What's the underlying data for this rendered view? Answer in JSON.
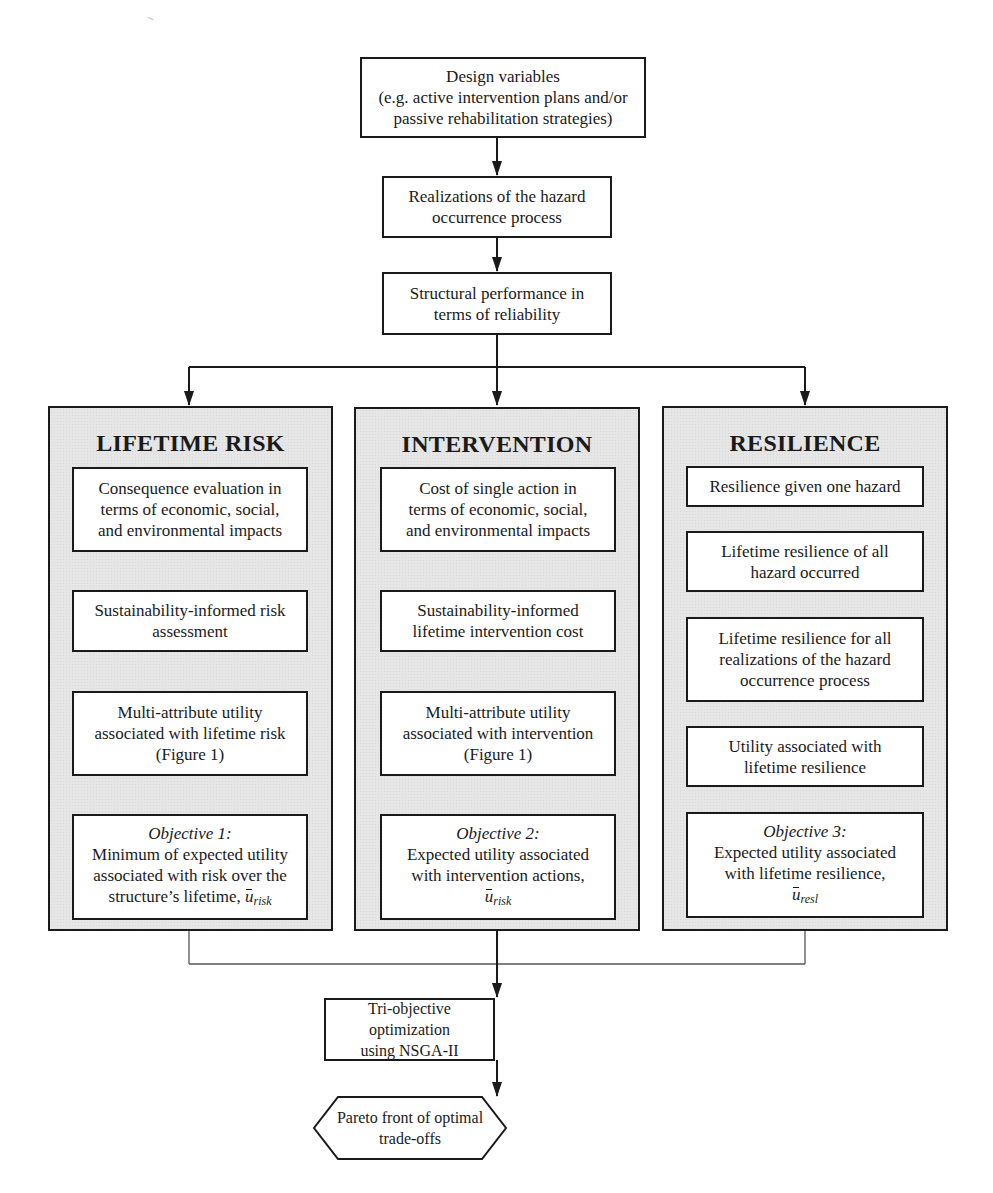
{
  "top": {
    "design_variables": {
      "lines": [
        "Design variables",
        "(e.g. active intervention plans and/or",
        "passive rehabilitation strategies)"
      ]
    },
    "realizations": {
      "lines": [
        "Realizations of the hazard",
        "occurrence process"
      ]
    },
    "structural_performance": {
      "lines": [
        "Structural performance in",
        "terms of reliability"
      ]
    }
  },
  "panels": [
    {
      "title": "LIFETIME RISK",
      "boxes": [
        {
          "lines": [
            "Consequence evaluation in",
            "terms of economic, social,",
            "and environmental impacts"
          ]
        },
        {
          "lines": [
            "Sustainability-informed risk",
            "assessment"
          ]
        },
        {
          "lines": [
            "Multi-attribute utility",
            "associated with lifetime risk",
            "(Figure 1)"
          ]
        },
        {
          "objective_label": "Objective 1:",
          "lines": [
            "Minimum of expected utility",
            "associated with risk over the",
            "structure’s lifetime,"
          ],
          "symbol": "u",
          "symbol_sub": "risk"
        }
      ]
    },
    {
      "title": "INTERVENTION",
      "boxes": [
        {
          "lines": [
            "Cost of single action in",
            "terms of economic, social,",
            "and environmental impacts"
          ]
        },
        {
          "lines": [
            "Sustainability-informed",
            "lifetime intervention cost"
          ]
        },
        {
          "lines": [
            "Multi-attribute utility",
            "associated with intervention",
            "(Figure 1)"
          ]
        },
        {
          "objective_label": "Objective 2:",
          "lines": [
            "Expected utility associated",
            "with intervention actions,"
          ],
          "symbol": "u",
          "symbol_sub": "risk"
        }
      ]
    },
    {
      "title": "RESILIENCE",
      "boxes": [
        {
          "lines": [
            "Resilience given one hazard"
          ]
        },
        {
          "lines": [
            "Lifetime resilience of all",
            "hazard occurred"
          ]
        },
        {
          "lines": [
            "Lifetime resilience for all",
            "realizations of the hazard",
            "occurrence process"
          ]
        },
        {
          "lines": [
            "Utility associated with",
            "lifetime resilience"
          ]
        },
        {
          "objective_label": "Objective 3:",
          "lines": [
            "Expected utility associated",
            "with lifetime resilience,"
          ],
          "symbol": "u",
          "symbol_sub": "resl"
        }
      ]
    }
  ],
  "bottom": {
    "optimization": {
      "lines": [
        "Tri-objective optimization",
        "using NSGA-II"
      ]
    },
    "result": {
      "lines": [
        "Pareto front of optimal",
        "trade-offs"
      ]
    }
  },
  "colors": {
    "panel_fill": "#e6e6e6",
    "stroke": "#1a1a1a",
    "background": "#ffffff"
  }
}
